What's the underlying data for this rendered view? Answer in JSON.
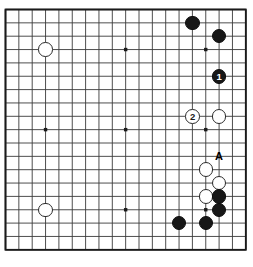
{
  "board": {
    "title": "Go board diagram",
    "size": 19,
    "columns": 19,
    "rows": 19,
    "origin_x": 5.5,
    "origin_y": 9.5,
    "spacing": 13.35,
    "line_color": "#3a3a3a",
    "border_color": "#1a1a1a",
    "background_color": "#ffffff",
    "star_point_color": "#1a1a1a",
    "star_points": [
      {
        "col": 4,
        "row": 4
      },
      {
        "col": 10,
        "row": 4
      },
      {
        "col": 16,
        "row": 4
      },
      {
        "col": 4,
        "row": 10
      },
      {
        "col": 10,
        "row": 10
      },
      {
        "col": 16,
        "row": 10
      },
      {
        "col": 4,
        "row": 16
      },
      {
        "col": 10,
        "row": 16
      },
      {
        "col": 16,
        "row": 16
      }
    ],
    "stone_diameter": 14.5,
    "black_color": "#171717",
    "white_color": "#ffffff",
    "stones": [
      {
        "id": "w-upper-left-hoshi",
        "color": "white",
        "col": 4,
        "row": 4,
        "label": ""
      },
      {
        "id": "b-top-right-a",
        "color": "black",
        "col": 15,
        "row": 2,
        "label": ""
      },
      {
        "id": "b-top-right-b",
        "color": "black",
        "col": 17,
        "row": 3,
        "label": ""
      },
      {
        "id": "b-move-1",
        "color": "black",
        "col": 17,
        "row": 6,
        "label": "1"
      },
      {
        "id": "w-move-2",
        "color": "white",
        "col": 15,
        "row": 9,
        "label": "2"
      },
      {
        "id": "w-right-side",
        "color": "white",
        "col": 17,
        "row": 9,
        "label": ""
      },
      {
        "id": "w-lower-right-a",
        "color": "white",
        "col": 16,
        "row": 13,
        "label": ""
      },
      {
        "id": "w-lower-right-b",
        "color": "white",
        "col": 17,
        "row": 14,
        "label": ""
      },
      {
        "id": "w-lower-right-c",
        "color": "white",
        "col": 16,
        "row": 15,
        "label": ""
      },
      {
        "id": "b-lower-right-a",
        "color": "black",
        "col": 17,
        "row": 15,
        "label": ""
      },
      {
        "id": "b-lower-right-b",
        "color": "black",
        "col": 17,
        "row": 16,
        "label": ""
      },
      {
        "id": "b-bottom-a",
        "color": "black",
        "col": 14,
        "row": 17,
        "label": ""
      },
      {
        "id": "b-bottom-b",
        "color": "black",
        "col": 16,
        "row": 17,
        "label": ""
      },
      {
        "id": "w-lower-left-hoshi",
        "color": "white",
        "col": 4,
        "row": 16,
        "label": ""
      }
    ],
    "markers": [
      {
        "id": "marker-a",
        "text": "A",
        "col": 17,
        "row": 12
      }
    ]
  }
}
